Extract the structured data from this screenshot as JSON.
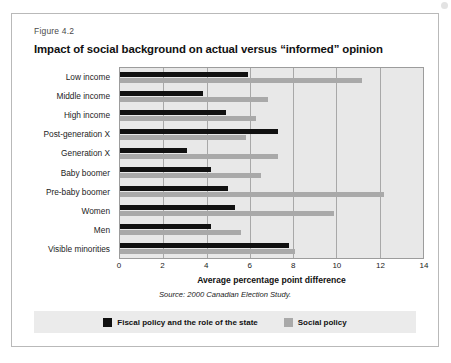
{
  "figure": {
    "number": "Figure 4.2",
    "title": "Impact of social background on actual versus “informed” opinion",
    "source": "Source: 2000 Canadian Election Study."
  },
  "legend": {
    "items": [
      {
        "label": "Fiscal policy and the role of the state",
        "color": "#111111",
        "key": "fiscal"
      },
      {
        "label": "Social policy",
        "color": "#a9a9a9",
        "key": "social"
      }
    ]
  },
  "chart_data": {
    "type": "bar",
    "orientation": "horizontal",
    "title": "Impact of social background on actual versus “informed” opinion",
    "subtitle": "Figure 4.2",
    "xlabel": "Average percentage point difference",
    "ylabel": "",
    "xlim": [
      0,
      14
    ],
    "xticks": [
      0,
      2,
      4,
      6,
      8,
      10,
      12,
      14
    ],
    "xtick_labels": [
      "0",
      "2",
      "4",
      "6",
      "8",
      "10",
      "12",
      "14"
    ],
    "grid": true,
    "legend_position": "bottom",
    "categories": [
      "Low income",
      "Middle income",
      "High income",
      "Post-generation X",
      "Generation X",
      "Baby boomer",
      "Pre-baby boomer",
      "Women",
      "Men",
      "Visible minorities"
    ],
    "series": [
      {
        "name": "Fiscal policy and the role of the state",
        "color": "#111111",
        "values": [
          5.9,
          3.85,
          4.9,
          7.3,
          3.1,
          4.2,
          5.0,
          5.3,
          4.2,
          7.8
        ]
      },
      {
        "name": "Social policy",
        "color": "#a9a9a9",
        "values": [
          11.2,
          6.85,
          6.3,
          5.8,
          7.3,
          6.5,
          12.2,
          9.9,
          5.6,
          8.1
        ]
      }
    ],
    "source": "Source: 2000 Canadian Election Study."
  }
}
